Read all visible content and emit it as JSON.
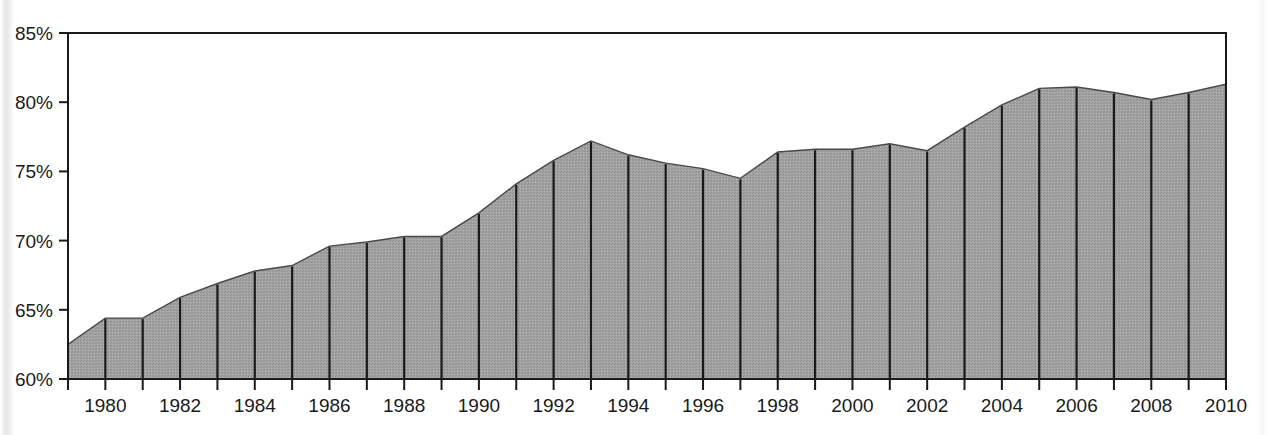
{
  "chart_data": {
    "type": "area",
    "title": "",
    "subtitle": "",
    "xlabel": "",
    "ylabel": "",
    "legend": [],
    "grid": false,
    "ylim": [
      60,
      85
    ],
    "yticks": [
      60,
      65,
      70,
      75,
      80,
      85
    ],
    "ytick_labels": [
      "60%",
      "65%",
      "70%",
      "75%",
      "80%",
      "85%"
    ],
    "ytick_suffix": "%",
    "xlim": [
      1979,
      2010
    ],
    "xticks": [
      1979,
      1980,
      1981,
      1982,
      1983,
      1984,
      1985,
      1986,
      1987,
      1988,
      1989,
      1990,
      1991,
      1992,
      1993,
      1994,
      1995,
      1996,
      1997,
      1998,
      1999,
      2000,
      2001,
      2002,
      2003,
      2004,
      2005,
      2006,
      2007,
      2008,
      2009,
      2010
    ],
    "xtick_labels_shown": [
      "1980",
      "1982",
      "1984",
      "1986",
      "1988",
      "1990",
      "1992",
      "1994",
      "1996",
      "1998",
      "2000",
      "2002",
      "2004",
      "2006",
      "2008",
      "2010"
    ],
    "x": [
      1979,
      1980,
      1981,
      1982,
      1983,
      1984,
      1985,
      1986,
      1987,
      1988,
      1989,
      1990,
      1991,
      1992,
      1993,
      1994,
      1995,
      1996,
      1997,
      1998,
      1999,
      2000,
      2001,
      2002,
      2003,
      2004,
      2005,
      2006,
      2007,
      2008,
      2009,
      2010
    ],
    "values": [
      62.5,
      64.4,
      64.4,
      65.9,
      66.9,
      67.8,
      68.2,
      69.6,
      69.9,
      70.3,
      70.3,
      72.0,
      74.1,
      75.8,
      77.2,
      76.2,
      75.6,
      75.2,
      74.5,
      76.4,
      76.6,
      76.6,
      77.0,
      76.5,
      78.2,
      79.8,
      81.0,
      81.1,
      80.7,
      80.2,
      80.7,
      81.3
    ],
    "series": [
      {
        "name": "series-1",
        "values": [
          62.5,
          64.4,
          64.4,
          65.9,
          66.9,
          67.8,
          68.2,
          69.6,
          69.9,
          70.3,
          70.3,
          72.0,
          74.1,
          75.8,
          77.2,
          76.2,
          75.6,
          75.2,
          74.5,
          76.4,
          76.6,
          76.6,
          77.0,
          76.5,
          78.2,
          79.8,
          81.0,
          81.1,
          80.7,
          80.2,
          80.7,
          81.3
        ],
        "fill_color": "#9a9a9a",
        "line_color": "#1a1a1a"
      }
    ],
    "colors": {
      "area_fill": "#9a9a9a",
      "area_fill_light": "#a8a8a8",
      "axis": "#1a1a1a",
      "separator": "#1a1a1a",
      "background": "#ffffff",
      "text": "#1a1a1a"
    }
  }
}
